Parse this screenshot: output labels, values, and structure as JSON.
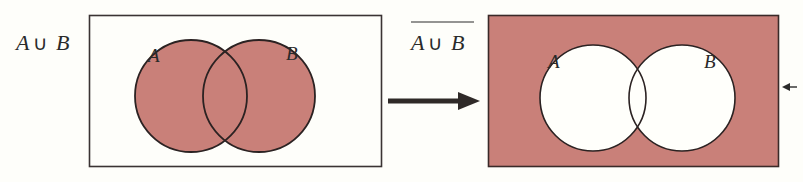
{
  "colors": {
    "background": "#fefefa",
    "shade": "#c98079",
    "outline": "#2b2222",
    "unshaded": "#fffffb"
  },
  "left_panel": {
    "title_a": "A",
    "title_op": "∪",
    "title_b": "B",
    "circle_a_label": "A",
    "circle_b_label": "B",
    "shaded_region": "A ∪ B"
  },
  "right_panel": {
    "title_a": "A",
    "title_op": "∪",
    "title_b": "B",
    "title_overline": true,
    "circle_a_label": "A",
    "circle_b_label": "B",
    "shaded_region": "complement of A ∪ B"
  },
  "connector": {
    "direction": "left-to-right"
  }
}
